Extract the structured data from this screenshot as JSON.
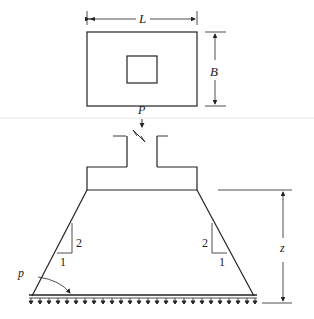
{
  "figure": {
    "plan_view": {
      "length_label": "L",
      "width_label": "B"
    },
    "elevation": {
      "load_label": "P",
      "depth_label": "z",
      "pressure_label": "p",
      "slope_left": {
        "rise": "2",
        "run": "1"
      },
      "slope_right": {
        "rise": "2",
        "run": "1"
      }
    },
    "colors": {
      "line": "#222222",
      "background": "#ffffff",
      "faint_rule": "#e6e6e6"
    }
  }
}
